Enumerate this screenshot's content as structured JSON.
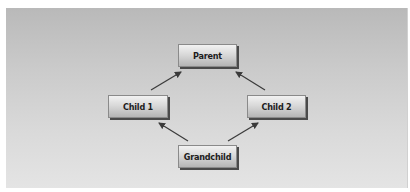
{
  "diagram": {
    "type": "inheritance-diamond",
    "nodes": [
      {
        "id": "parent",
        "label": "Parent"
      },
      {
        "id": "child1",
        "label": "Child 1"
      },
      {
        "id": "child2",
        "label": "Child 2"
      },
      {
        "id": "grandchild",
        "label": "Grandchild"
      }
    ],
    "edges": [
      {
        "from": "Child 1",
        "to": "Parent"
      },
      {
        "from": "Child 2",
        "to": "Parent"
      },
      {
        "from": "Grandchild",
        "to": "Child 1"
      },
      {
        "from": "Grandchild",
        "to": "Child 2"
      }
    ],
    "colors": {
      "background_top": "#b9b9b9",
      "background_bottom": "#e4e4e4",
      "node_fill": "#d9d9d9",
      "arrow": "#3a3a3a"
    }
  }
}
